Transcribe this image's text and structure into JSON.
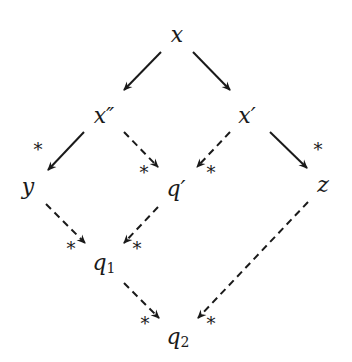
{
  "diagram": {
    "nodes": [
      {
        "id": "x",
        "label": "x",
        "sub": ""
      },
      {
        "id": "x2",
        "label": "x″",
        "sub": ""
      },
      {
        "id": "x1",
        "label": "x′",
        "sub": ""
      },
      {
        "id": "y",
        "label": "y",
        "sub": ""
      },
      {
        "id": "qp",
        "label": "q′",
        "sub": ""
      },
      {
        "id": "z",
        "label": "z",
        "sub": ""
      },
      {
        "id": "q1",
        "label": "q",
        "sub": "1"
      },
      {
        "id": "q2",
        "label": "q",
        "sub": "2"
      }
    ],
    "edges": [
      {
        "from": "x",
        "to": "x2",
        "style": "solid",
        "star": false
      },
      {
        "from": "x",
        "to": "x1",
        "style": "solid",
        "star": false
      },
      {
        "from": "x2",
        "to": "y",
        "style": "solid",
        "star": true
      },
      {
        "from": "x2",
        "to": "qp",
        "style": "dashed",
        "star": true
      },
      {
        "from": "x1",
        "to": "qp",
        "style": "dashed",
        "star": true
      },
      {
        "from": "x1",
        "to": "z",
        "style": "solid",
        "star": true
      },
      {
        "from": "y",
        "to": "q1",
        "style": "dashed",
        "star": true
      },
      {
        "from": "qp",
        "to": "q1",
        "style": "dashed",
        "star": true
      },
      {
        "from": "q1",
        "to": "q2",
        "style": "dashed",
        "star": true
      },
      {
        "from": "z",
        "to": "q2",
        "style": "dashed",
        "star": true
      }
    ],
    "star_symbol": "*"
  }
}
